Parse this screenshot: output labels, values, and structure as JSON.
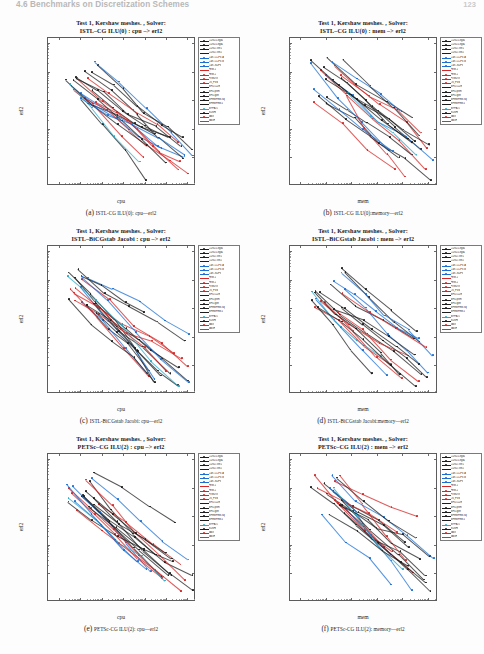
{
  "header": {
    "running_title": "4.6 Benchmarks on Discretization Schemes",
    "page_number": "123"
  },
  "axis": {
    "y_label": "erl2",
    "x_label_cpu": "cpu",
    "x_label_mem": "mem",
    "y_ticks": [
      "10⁰",
      "10⁻¹",
      "10⁻²",
      "10⁻³",
      "10⁻⁴"
    ],
    "x_ticks_cpu": [
      "10⁻³",
      "10⁻²",
      "10⁻¹",
      "10⁰",
      "10¹",
      "10²",
      "10³"
    ],
    "x_ticks_mem": [
      "10¹",
      "10²",
      "10³",
      "10⁴",
      "10⁵",
      "10⁶"
    ]
  },
  "legend": {
    "entries": [
      {
        "label": "CDG2-Legd1",
        "color": "#1d1d1d"
      },
      {
        "label": "CDG2-Legd2",
        "color": "#1d1d1d"
      },
      {
        "label": "CDG2-Tetr1",
        "color": "#1d1d1d"
      },
      {
        "label": "CDG2-Tetr2",
        "color": "#1d1d1d"
      },
      {
        "label": "Cart.-CCFV-A",
        "color": "#1a6fd4"
      },
      {
        "label": "Cart.-CCFV-B",
        "color": "#1a6fd4"
      },
      {
        "label": "Cart.-SDFV",
        "color": "#1a6fd4"
      },
      {
        "label": "FEM-1",
        "color": "#d42626"
      },
      {
        "label": "FEM-2",
        "color": "#d42626"
      },
      {
        "label": "FVMDG",
        "color": "#d42626"
      },
      {
        "label": "LS_FVM",
        "color": "#d42626"
      },
      {
        "label": "MFD-CDE",
        "color": "#1d1d1d"
      },
      {
        "label": "MFD-prim",
        "color": "#1d1d1d"
      },
      {
        "label": "MFD-gen",
        "color": "#1d1d1d"
      },
      {
        "label": "MFEMFEM-sq",
        "color": "#1d1d1d"
      },
      {
        "label": "MFEMFEM-L",
        "color": "#1d1d1d"
      },
      {
        "label": "MPFA-O",
        "color": "#2aa8c8"
      },
      {
        "label": "SUSHI",
        "color": "#1d1d1d"
      },
      {
        "label": "VAG",
        "color": "#d42626"
      },
      {
        "label": "VAGH",
        "color": "#1a6fd4"
      }
    ]
  },
  "figures": [
    {
      "title_line1": "Test 1, Kershaw meshes. , Solver:",
      "title_line2": "ISTL–CG ILU(0) : cpu –> erl2",
      "x_label": "cpu",
      "x_type": "cpu",
      "caption_label": "(a)",
      "caption_text": "ISTL-CG ILU(0): cpu—erl2"
    },
    {
      "title_line1": "Test 1, Kershaw meshes. , Solver:",
      "title_line2": "ISTL–CG ILU(0) : mem –> erl2",
      "x_label": "mem",
      "x_type": "mem",
      "caption_label": "(b)",
      "caption_text": "ISTL-CG ILU(0):memory—erl2"
    },
    {
      "title_line1": "Test 1, Kershaw meshes. , Solver:",
      "title_line2": "ISTL–BiCGstab Jacobi : cpu –> erl2",
      "x_label": "cpu",
      "x_type": "cpu",
      "caption_label": "(c)",
      "caption_text": "ISTL-BiCGstab Jacobi: cpu—erl2"
    },
    {
      "title_line1": "Test 1, Kershaw meshes. , Solver:",
      "title_line2": "ISTL–BiCGstab Jacobi : mem –> erl2",
      "x_label": "mem",
      "x_type": "mem",
      "caption_label": "(d)",
      "caption_text": "ISTL-BiCGstab Jacobi:memory—erl2"
    },
    {
      "title_line1": "Test 1, Kershaw meshes. , Solver:",
      "title_line2": "PETSc–CG ILU(2) : cpu –> erl2",
      "x_label": "cpu",
      "x_type": "cpu",
      "caption_label": "(e)",
      "caption_text": "PETSc-CG ILU(2): cpu—erl2"
    },
    {
      "title_line1": "Test 1, Kershaw meshes. , Solver:",
      "title_line2": "PETSc–CG ILU(2) : mem –> erl2",
      "x_label": "mem",
      "x_type": "mem",
      "caption_label": "(f)",
      "caption_text": "PETSc-CG ILU(2): memory—erl2"
    }
  ],
  "chart_data": [
    {
      "type": "scatter",
      "title": "Test 1, Kershaw meshes. , Solver: ISTL–CG ILU(0) : cpu –> erl2",
      "xlabel": "cpu",
      "ylabel": "erl2",
      "xscale": "log",
      "yscale": "log",
      "xlim": [
        0.0005,
        3000
      ],
      "ylim": [
        1e-05,
        1.5
      ],
      "grid": false,
      "legend_position": "right-outside",
      "series": [
        {
          "name": "CDG2-Legd1",
          "color": "#1d1d1d",
          "points": [
            [
              0.004,
              0.09
            ],
            [
              0.03,
              0.05
            ],
            [
              0.3,
              0.025
            ],
            [
              3,
              0.012
            ],
            [
              30,
              0.006
            ]
          ]
        },
        {
          "name": "CDG2-Legd2",
          "color": "#1d1d1d",
          "points": [
            [
              0.008,
              0.06
            ],
            [
              0.07,
              0.03
            ],
            [
              0.6,
              0.013
            ],
            [
              6,
              0.005
            ],
            [
              60,
              0.0022
            ]
          ]
        },
        {
          "name": "CDG2-Tetr1",
          "color": "#1d1d1d",
          "points": [
            [
              0.01,
              0.2
            ],
            [
              0.1,
              0.08
            ],
            [
              1,
              0.03
            ],
            [
              10,
              0.012
            ],
            [
              100,
              0.005
            ]
          ]
        },
        {
          "name": "CDG2-Tetr2",
          "color": "#1d1d1d",
          "points": [
            [
              0.02,
              0.12
            ],
            [
              0.2,
              0.05
            ],
            [
              2,
              0.018
            ],
            [
              20,
              0.007
            ],
            [
              200,
              0.0028
            ]
          ]
        },
        {
          "name": "Cart.-CCFV-A",
          "color": "#1a6fd4",
          "points": [
            [
              0.002,
              0.05
            ],
            [
              0.02,
              0.02
            ],
            [
              0.2,
              0.008
            ],
            [
              2,
              0.003
            ],
            [
              20,
              0.0011
            ]
          ]
        },
        {
          "name": "Cart.-CCFV-B",
          "color": "#1a6fd4",
          "points": [
            [
              0.003,
              0.04
            ],
            [
              0.03,
              0.016
            ],
            [
              0.35,
              0.006
            ],
            [
              3.5,
              0.0022
            ],
            [
              35,
              0.0008
            ]
          ]
        },
        {
          "name": "Cart.-SDFV",
          "color": "#1a6fd4",
          "points": [
            [
              0.006,
              0.03
            ],
            [
              0.06,
              0.012
            ],
            [
              0.6,
              0.0045
            ],
            [
              6,
              0.0016
            ],
            [
              60,
              0.0006
            ]
          ]
        },
        {
          "name": "FEM-1",
          "color": "#d42626",
          "points": [
            [
              0.005,
              0.11
            ],
            [
              0.05,
              0.055
            ],
            [
              0.5,
              0.027
            ],
            [
              5,
              0.013
            ],
            [
              50,
              0.0065
            ]
          ]
        },
        {
          "name": "FEM-2",
          "color": "#d42626",
          "points": [
            [
              0.01,
              0.08
            ],
            [
              0.09,
              0.04
            ],
            [
              0.9,
              0.02
            ],
            [
              9,
              0.01
            ],
            [
              90,
              0.005
            ]
          ]
        },
        {
          "name": "FVMDG",
          "color": "#d42626",
          "points": [
            [
              0.007,
              0.13
            ],
            [
              0.07,
              0.06
            ],
            [
              0.7,
              0.03
            ],
            [
              7,
              0.015
            ],
            [
              70,
              0.007
            ]
          ]
        },
        {
          "name": "LS_FVM",
          "color": "#d42626",
          "points": [
            [
              0.012,
              0.1
            ],
            [
              0.12,
              0.045
            ],
            [
              1.2,
              0.022
            ],
            [
              12,
              0.01
            ],
            [
              120,
              0.0048
            ]
          ]
        },
        {
          "name": "MFD-CDE",
          "color": "#1d1d1d",
          "points": [
            [
              0.004,
              0.15
            ],
            [
              0.04,
              0.07
            ],
            [
              0.45,
              0.033
            ],
            [
              4.5,
              0.016
            ],
            [
              45,
              0.0075
            ]
          ]
        },
        {
          "name": "MFD-prim",
          "color": "#1d1d1d",
          "points": [
            [
              0.006,
              0.12
            ],
            [
              0.06,
              0.058
            ],
            [
              0.65,
              0.028
            ],
            [
              6.5,
              0.013
            ],
            [
              65,
              0.0062
            ]
          ]
        },
        {
          "name": "MFD-gen",
          "color": "#1d1d1d",
          "points": [
            [
              0.009,
              0.1
            ],
            [
              0.08,
              0.05
            ],
            [
              0.85,
              0.024
            ],
            [
              8.5,
              0.011
            ],
            [
              85,
              0.0055
            ]
          ]
        },
        {
          "name": "MFEMFEM-sq",
          "color": "#1d1d1d",
          "points": [
            [
              0.015,
              0.07
            ],
            [
              0.15,
              0.034
            ],
            [
              1.5,
              0.016
            ],
            [
              15,
              0.0077
            ],
            [
              150,
              0.0036
            ]
          ]
        },
        {
          "name": "MFEMFEM-L",
          "color": "#1d1d1d",
          "points": [
            [
              0.02,
              0.06
            ],
            [
              0.22,
              0.029
            ],
            [
              2.2,
              0.014
            ],
            [
              22,
              0.0066
            ],
            [
              220,
              0.0031
            ]
          ]
        },
        {
          "name": "MPFA-O",
          "color": "#2aa8c8",
          "points": [
            [
              0.003,
              0.035
            ],
            [
              0.028,
              0.012
            ],
            [
              0.28,
              0.004
            ],
            [
              2.8,
              0.0013
            ],
            [
              28,
              0.00045
            ]
          ]
        },
        {
          "name": "SUSHI",
          "color": "#1d1d1d",
          "points": [
            [
              0.005,
              0.16
            ],
            [
              0.05,
              0.075
            ],
            [
              0.55,
              0.035
            ],
            [
              5.5,
              0.017
            ],
            [
              55,
              0.008
            ]
          ]
        },
        {
          "name": "VAG",
          "color": "#d42626",
          "points": [
            [
              0.008,
              0.09
            ],
            [
              0.075,
              0.043
            ],
            [
              0.75,
              0.021
            ],
            [
              7.5,
              0.0098
            ],
            [
              75,
              0.0046
            ]
          ]
        },
        {
          "name": "VAGH",
          "color": "#1a6fd4",
          "points": [
            [
              0.004,
              0.045
            ],
            [
              0.04,
              0.017
            ],
            [
              0.4,
              0.0065
            ],
            [
              4,
              0.0024
            ],
            [
              40,
              0.0009
            ]
          ]
        }
      ]
    },
    {
      "type": "scatter",
      "title": "Test 1, Kershaw meshes. , Solver: ISTL–CG ILU(0) : mem –> erl2",
      "xlabel": "mem",
      "ylabel": "erl2",
      "xscale": "log",
      "yscale": "log",
      "xlim": [
        5,
        3000000
      ],
      "ylim": [
        1e-05,
        1.5
      ],
      "grid": false,
      "legend_position": "right-outside"
    },
    {
      "type": "scatter",
      "title": "Test 1, Kershaw meshes. , Solver: ISTL–BiCGstab Jacobi : cpu –> erl2",
      "xlabel": "cpu",
      "ylabel": "erl2",
      "xscale": "log",
      "yscale": "log",
      "xlim": [
        0.0005,
        3000
      ],
      "ylim": [
        1e-05,
        1.5
      ],
      "grid": false,
      "legend_position": "right-outside"
    },
    {
      "type": "scatter",
      "title": "Test 1, Kershaw meshes. , Solver: ISTL–BiCGstab Jacobi : mem –> erl2",
      "xlabel": "mem",
      "ylabel": "erl2",
      "xscale": "log",
      "yscale": "log",
      "xlim": [
        5,
        3000000
      ],
      "ylim": [
        1e-05,
        1.5
      ],
      "grid": false,
      "legend_position": "right-outside"
    },
    {
      "type": "scatter",
      "title": "Test 1, Kershaw meshes. , Solver: PETSc–CG ILU(2) : cpu –> erl2",
      "xlabel": "cpu",
      "ylabel": "erl2",
      "xscale": "log",
      "yscale": "log",
      "xlim": [
        0.0005,
        3000
      ],
      "ylim": [
        1e-05,
        1.5
      ],
      "grid": false,
      "legend_position": "right-outside"
    },
    {
      "type": "scatter",
      "title": "Test 1, Kershaw meshes. , Solver: PETSc–CG ILU(2) : mem –> erl2",
      "xlabel": "mem",
      "ylabel": "erl2",
      "xscale": "log",
      "yscale": "log",
      "xlim": [
        5,
        3000000
      ],
      "ylim": [
        1e-05,
        1.5
      ],
      "grid": false,
      "legend_position": "right-outside"
    }
  ]
}
